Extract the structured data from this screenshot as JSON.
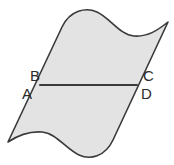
{
  "figure": {
    "kind": "geometry-diagram",
    "background_color": "#ffffff",
    "surface": {
      "fill_color": "#e3e3e3",
      "stroke_color": "#3a3a3a",
      "stroke_width": 1.6
    },
    "segment": {
      "stroke_color": "#3a3a3a",
      "stroke_width": 2.0
    },
    "labels": {
      "a": "A",
      "b": "B",
      "c": "C",
      "d": "D",
      "color": "#2b2b2b",
      "font_size": "15px"
    }
  }
}
